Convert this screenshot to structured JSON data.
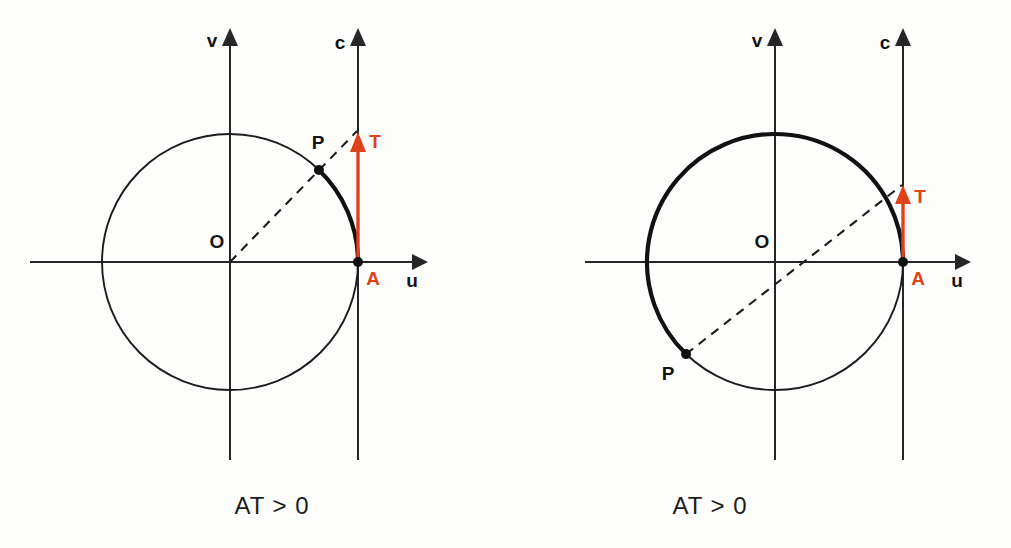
{
  "figure": {
    "background": "#fdfdfc",
    "accent_red": "#DE4218",
    "ink": "#1c1c1c",
    "panel_count": 2
  },
  "panels": [
    {
      "id": "left",
      "caption": "AT > 0",
      "axis_labels": {
        "horizontal": "u",
        "vertical": "v",
        "tangent": "c"
      },
      "points": {
        "origin_label": "O",
        "point_p_label": "P",
        "point_a_label": "A",
        "tangent_tip_label": "T"
      },
      "geometry": {
        "origin": [
          230,
          262
        ],
        "radius": 128,
        "angle_p_deg": 46,
        "tangent_line_x": 358,
        "tangent_tip_y": 134,
        "arc_bold_from_deg": 0,
        "arc_bold_to_deg": 46,
        "x_axis_from": 30,
        "x_axis_to": 424,
        "y_axis_top": 32,
        "y_axis_bottom": 460,
        "c_axis_top": 32,
        "c_axis_bottom": 460
      }
    },
    {
      "id": "right",
      "caption": "AT > 0",
      "axis_labels": {
        "horizontal": "u",
        "vertical": "v",
        "tangent": "c"
      },
      "points": {
        "origin_label": "O",
        "point_p_label": "P",
        "point_a_label": "A",
        "tangent_tip_label": "T"
      },
      "geometry": {
        "origin": [
          270,
          262
        ],
        "radius": 128,
        "angle_p_deg": 226,
        "tangent_line_x": 398,
        "tangent_tip_y": 188,
        "arc_bold_from_deg": 0,
        "arc_bold_to_deg": 226,
        "x_axis_from": 80,
        "x_axis_to": 462,
        "y_axis_top": 32,
        "y_axis_bottom": 460,
        "c_axis_top": 32,
        "c_axis_bottom": 460
      }
    }
  ]
}
